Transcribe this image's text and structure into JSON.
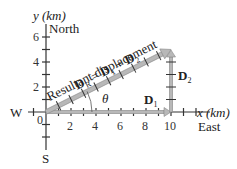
{
  "diagram": {
    "y_axis_label": "y (km)",
    "x_axis_label": "x (km)",
    "north_label": "North",
    "east_label": "East",
    "west_label": "W",
    "south_label": "S",
    "origin_label": "0",
    "x_ticks": [
      "2",
      "4",
      "6",
      "8",
      "10"
    ],
    "y_ticks": [
      "2",
      "4",
      "6"
    ],
    "resultant_text": "Resultant displacement",
    "equation": {
      "lhs": "D",
      "lhs_sub": "R",
      "eq": " = ",
      "t1": "D",
      "t1_sub": "1",
      "plus": " + ",
      "t2": "D",
      "t2_sub": "2"
    },
    "d1_label": "D",
    "d1_sub": "1",
    "d2_label": "D",
    "d2_sub": "2",
    "angle_label": "θ",
    "vectors": {
      "D1": {
        "from": [
          0,
          0
        ],
        "to": [
          10,
          0
        ],
        "units": "km"
      },
      "D2": {
        "from": [
          10,
          0
        ],
        "to": [
          10,
          5
        ],
        "units": "km"
      },
      "DR": {
        "from": [
          0,
          0
        ],
        "to": [
          10,
          5
        ],
        "units": "km"
      }
    },
    "colors": {
      "vector_fill": "#b8b8b8",
      "vector_edge": "#8a8a8a",
      "axis": "#333333"
    }
  }
}
